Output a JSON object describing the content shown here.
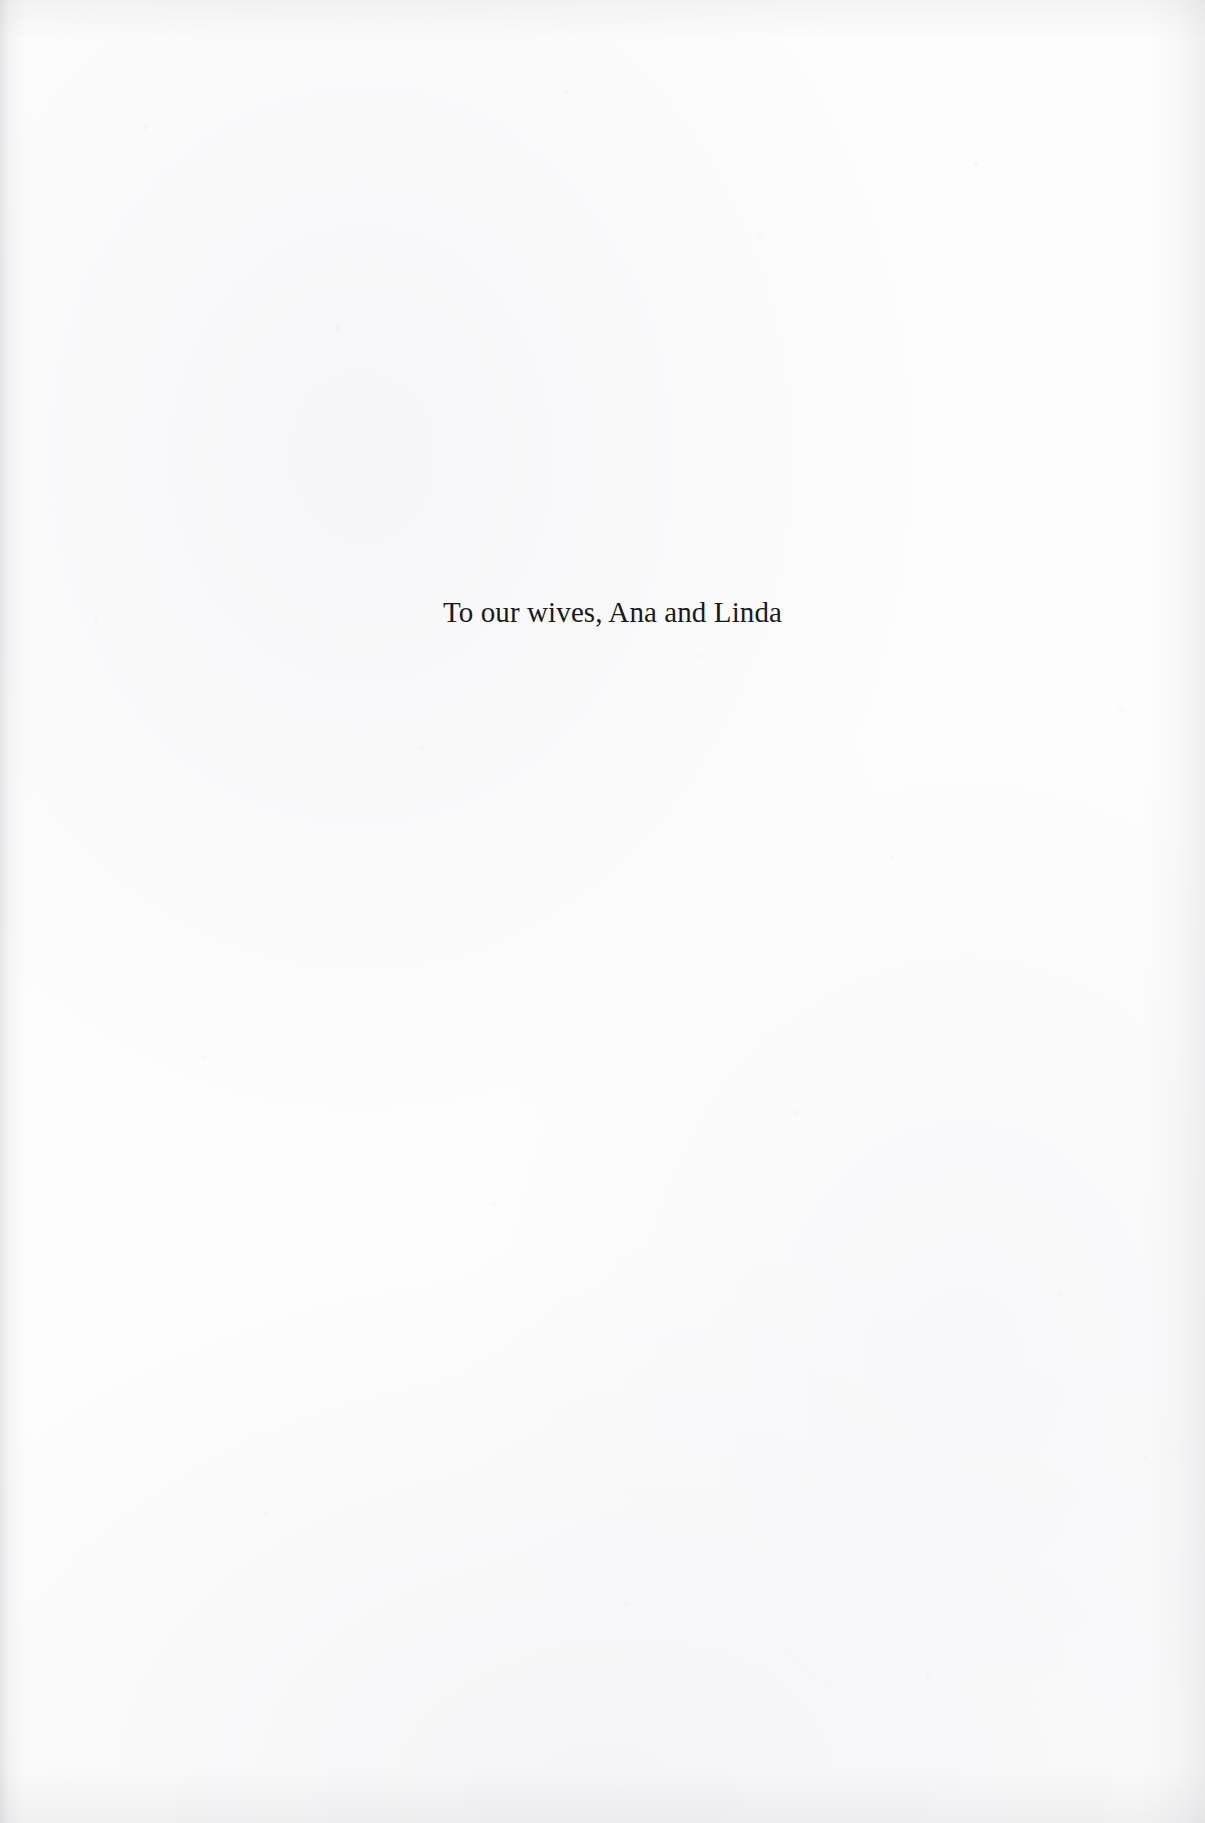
{
  "page": {
    "kind": "scanned-book-dedication-page",
    "background_color": "#fdfdfd",
    "text_color": "#1a1a1a",
    "width_px": 1205,
    "height_px": 1823
  },
  "dedication": {
    "text": "To our wives, Ana and Linda"
  }
}
